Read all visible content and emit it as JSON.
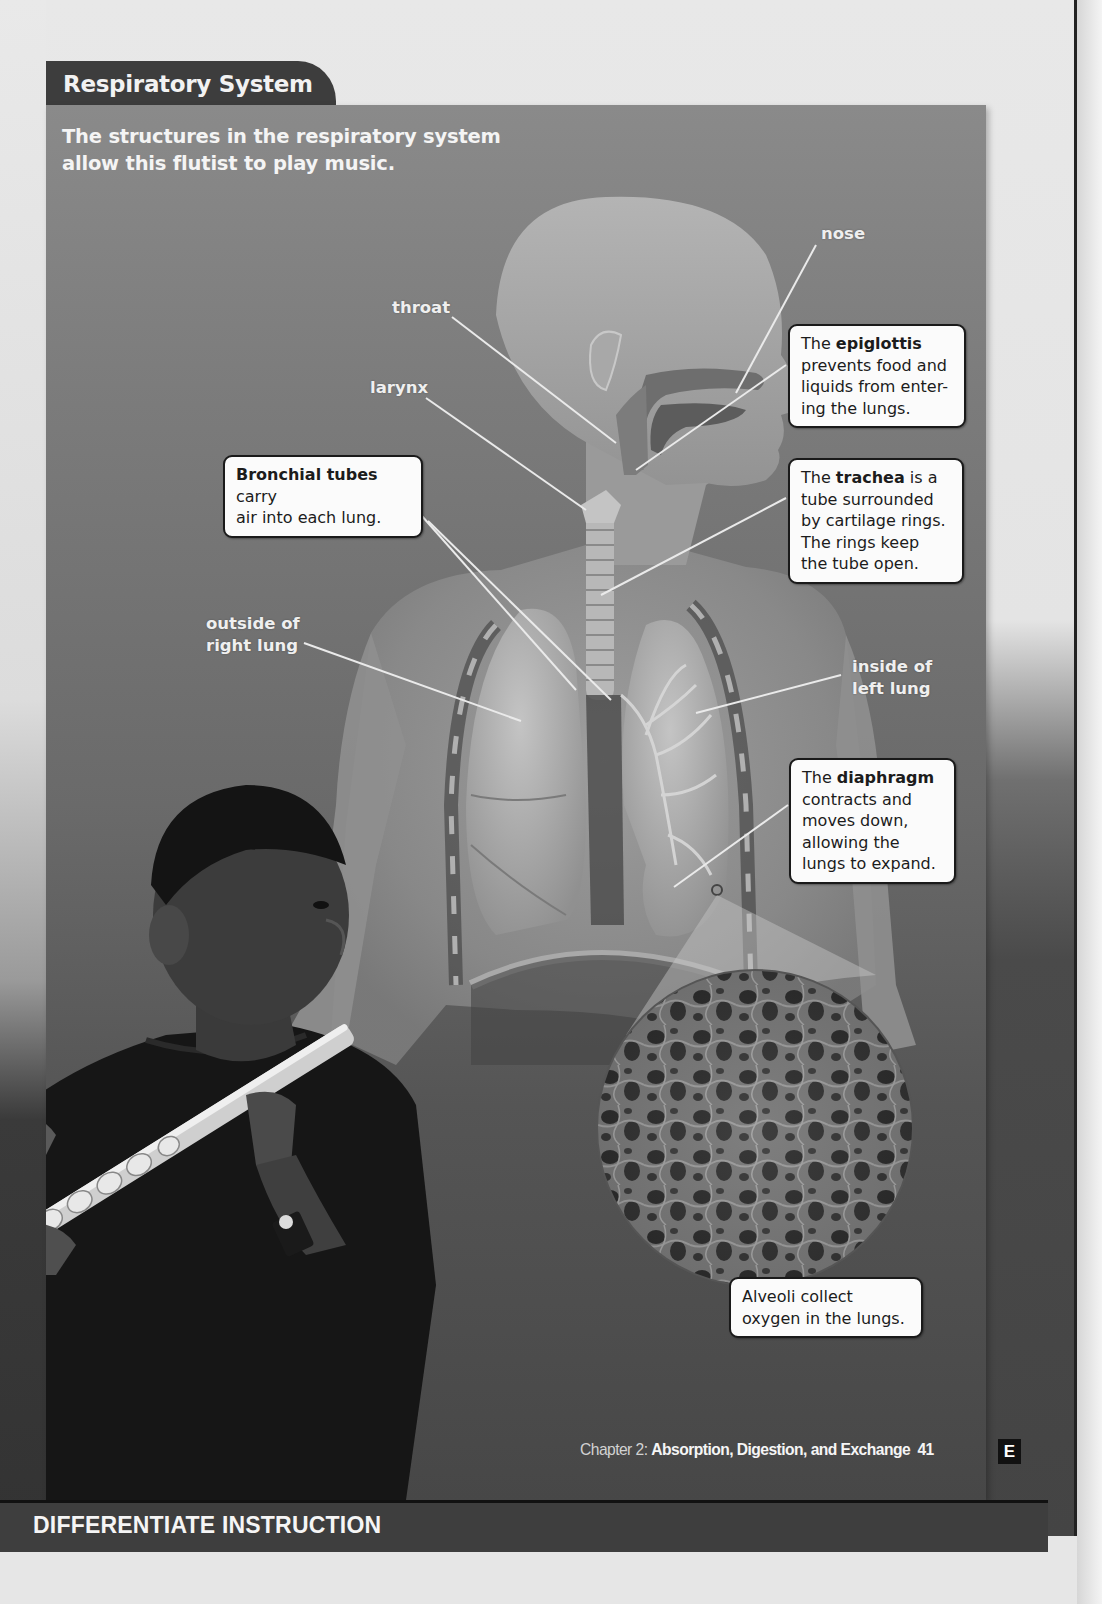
{
  "page": {
    "section_tab": "Respiratory System",
    "caption": "The structures in the respiratory system allow this flutist to play music."
  },
  "labels": {
    "nose": "nose",
    "throat": "throat",
    "larynx": "larynx",
    "outside_right_lung_1": "outside of",
    "outside_right_lung_2": "right lung",
    "inside_left_lung_1": "inside of",
    "inside_left_lung_2": "left lung"
  },
  "callouts": {
    "epiglottis": {
      "prefix": "The ",
      "term": "epiglottis",
      "lines": [
        "prevents food and",
        "liquids from enter-",
        "ing the lungs."
      ]
    },
    "trachea": {
      "prefix": "The ",
      "term": "trachea",
      "suffix": " is a",
      "lines": [
        "tube surrounded",
        "by cartilage rings.",
        "The rings keep",
        "the tube open."
      ]
    },
    "bronchial": {
      "term": "Bronchial tubes",
      "suffix": " carry",
      "lines": [
        "air into each lung."
      ]
    },
    "diaphragm": {
      "prefix": "The ",
      "term": "diaphragm",
      "lines": [
        "contracts and",
        "moves down,",
        "allowing the",
        "lungs to expand."
      ]
    },
    "alveoli": {
      "lines": [
        "Alveoli collect",
        "oxygen in the lungs."
      ]
    }
  },
  "footer": {
    "chapter_prefix": "Chapter 2: ",
    "chapter_title": "Absorption, Digestion, and Exchange",
    "page_number": "41",
    "edition_badge": "E"
  },
  "bottom_band": {
    "title": "DIFFERENTIATE INSTRUCTION"
  },
  "colors": {
    "tab_bg": "#3d3d3d",
    "callout_bg": "#fbfbfb",
    "band_bg": "#3e3e3e"
  }
}
